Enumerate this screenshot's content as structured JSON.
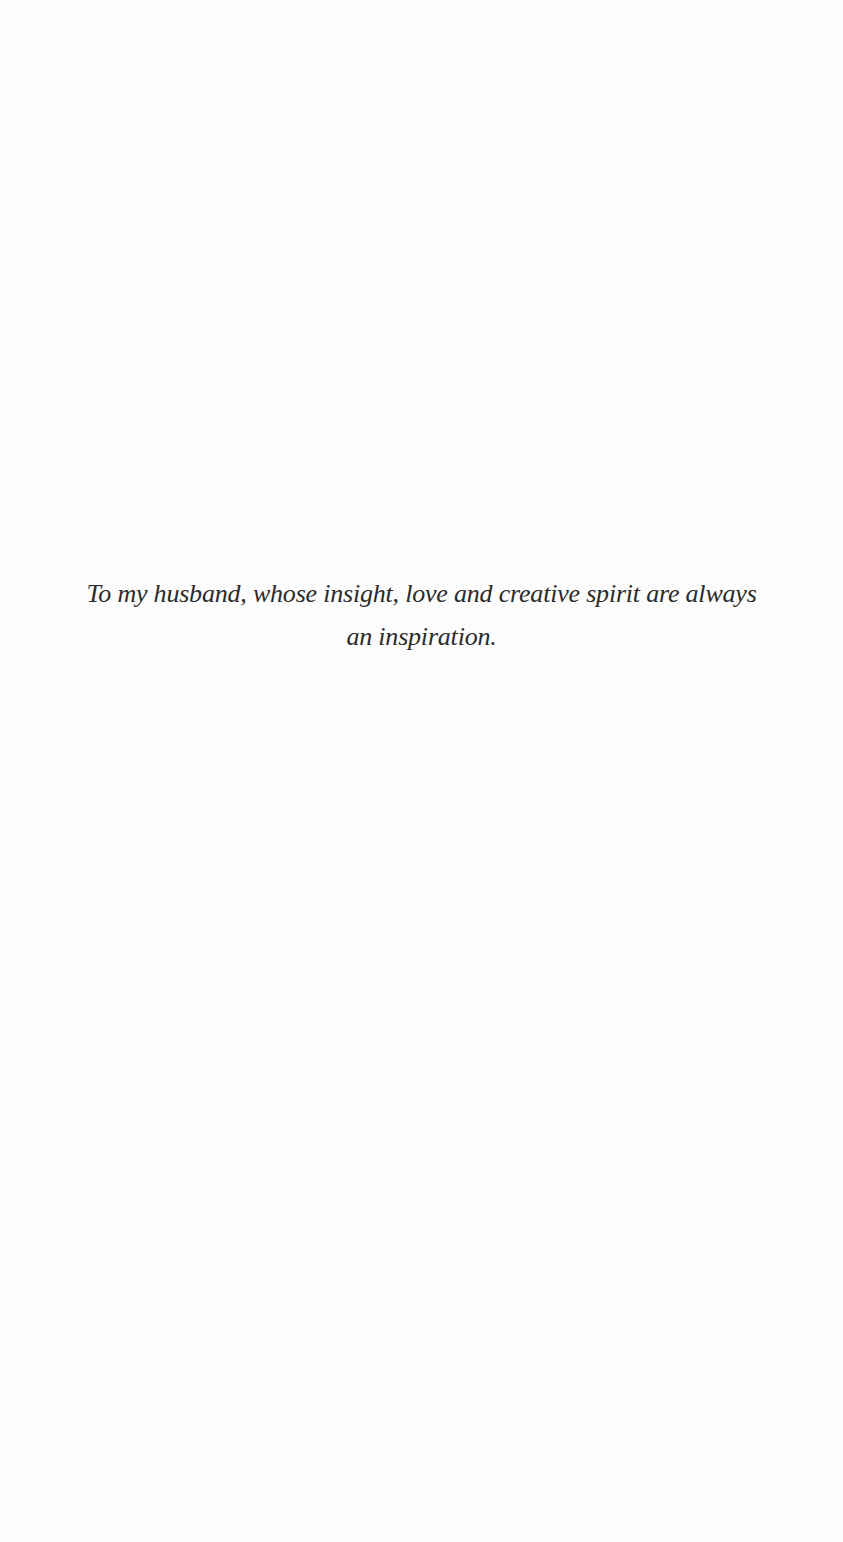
{
  "page": {
    "type": "dedication",
    "background_color": "#fcfcfc",
    "text_color": "#2b2b2b"
  },
  "dedication": {
    "full_text": "To my husband, whose insight, love and creative spirit are always an inspiration.",
    "lines": [
      "To my husband, whose insight, love and creative spirit are always",
      "an inspiration."
    ]
  }
}
